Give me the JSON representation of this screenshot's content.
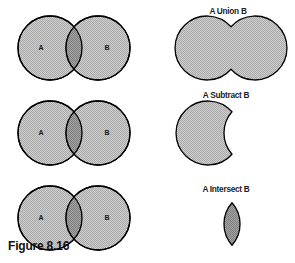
{
  "figure": {
    "caption": "Figure 8.16",
    "set_a_label": "A",
    "set_b_label": "B",
    "colors": {
      "fill": "#c3c3c3",
      "intersection_fill": "#9b9b9b",
      "outline": "#000000",
      "background": "#ffffff",
      "text": "#101010"
    }
  },
  "venn_diagrams": [
    {
      "name": "venn-top",
      "a": "A",
      "b": "B"
    },
    {
      "name": "venn-middle",
      "a": "A",
      "b": "B"
    },
    {
      "name": "venn-bottom",
      "a": "A",
      "b": "B"
    }
  ],
  "operations": [
    {
      "label": "A Union B",
      "shape": "union"
    },
    {
      "label": "A Subtract B",
      "shape": "crescent"
    },
    {
      "label": "A Intersect B",
      "shape": "lens"
    }
  ]
}
